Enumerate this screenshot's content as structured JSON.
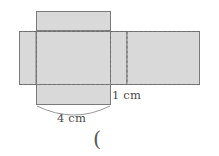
{
  "figure": {
    "colors": {
      "face_fill": "#d9d9d9",
      "face_stroke": "#808080",
      "fold_line": "#6e6e6e",
      "brace": "#9a9a9a",
      "text": "#4a4a4a",
      "background": "#ffffff"
    },
    "faces": [
      {
        "name": "top-flap",
        "x": 36,
        "y": 11,
        "width": 75,
        "height": 20
      },
      {
        "name": "left-face",
        "x": 19,
        "y": 31,
        "width": 17,
        "height": 54
      },
      {
        "name": "center-face",
        "x": 36,
        "y": 31,
        "width": 75,
        "height": 54
      },
      {
        "name": "right-face-1",
        "x": 111,
        "y": 31,
        "width": 16,
        "height": 54
      },
      {
        "name": "right-face-2",
        "x": 127,
        "y": 31,
        "width": 73,
        "height": 54
      },
      {
        "name": "bottom-flap",
        "x": 36,
        "y": 85,
        "width": 75,
        "height": 20
      }
    ],
    "fold_lines": [
      {
        "name": "fold-vertical-left",
        "x1": 36,
        "y1": 31,
        "x2": 36,
        "y2": 85
      },
      {
        "name": "fold-vertical-middle",
        "x1": 111,
        "y1": 31,
        "x2": 111,
        "y2": 85
      },
      {
        "name": "fold-vertical-right",
        "x1": 127,
        "y1": 31,
        "x2": 127,
        "y2": 85
      },
      {
        "name": "fold-horizontal-top",
        "x1": 19,
        "y1": 31,
        "x2": 200,
        "y2": 31
      },
      {
        "name": "fold-horizontal-bottom",
        "x1": 19,
        "y1": 85,
        "x2": 200,
        "y2": 85
      }
    ],
    "labels": {
      "width_label": "4 cm",
      "depth_label": "1 cm",
      "trailing_paren": "("
    },
    "brace": {
      "name": "width-brace",
      "from_x": 37,
      "to_x": 110,
      "y": 106,
      "depth": 11
    }
  }
}
